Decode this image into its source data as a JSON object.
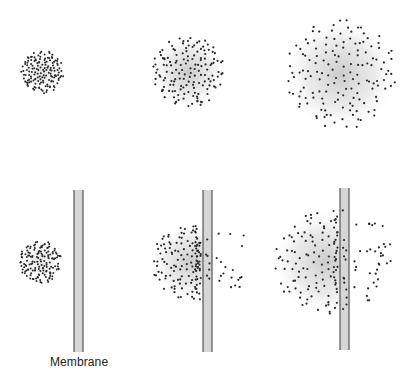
{
  "diagram": {
    "title": "",
    "label_membrane": "Membrane",
    "colors": {
      "dot": "#2a2a2a",
      "cloud": "#9a9a9a",
      "membrane_fill": "#d6d6d6",
      "membrane_edge": "#555555"
    },
    "rows": [
      {
        "name": "free-diffusion",
        "panels": [
          {
            "stage": 1,
            "cx": 42,
            "cy": 72,
            "r": 21,
            "dots": 150,
            "dot_r": 1.0,
            "cloud_r": 20,
            "cloud_opacity": 0.25
          },
          {
            "stage": 2,
            "cx": 188,
            "cy": 72,
            "r": 36,
            "dots": 150,
            "dot_r": 1.1,
            "cloud_r": 38,
            "cloud_opacity": 0.45
          },
          {
            "stage": 3,
            "cx": 341,
            "cy": 74,
            "r": 55,
            "dots": 150,
            "dot_r": 1.1,
            "cloud_r": 58,
            "cloud_opacity": 0.45
          }
        ]
      },
      {
        "name": "diffusion-through-membrane",
        "panels": [
          {
            "stage": 1,
            "cx": 40,
            "cy": 262,
            "r": 21,
            "dots": 150,
            "dot_r": 1.0,
            "cloud_r": 20,
            "cloud_opacity": 0.25,
            "membrane": {
              "x": 74,
              "y": 190,
              "w": 9,
              "h": 162
            },
            "cross_fraction": 0.0
          },
          {
            "stage": 2,
            "cx": 190,
            "cy": 262,
            "r": 38,
            "dots": 150,
            "dot_r": 1.1,
            "cloud_r": 40,
            "cloud_opacity": 0.45,
            "membrane": {
              "x": 203,
              "y": 190,
              "w": 9,
              "h": 162
            },
            "cross_fraction": 0.12
          },
          {
            "stage": 3,
            "cx": 326,
            "cy": 262,
            "r": 52,
            "dots": 150,
            "dot_r": 1.1,
            "cloud_r": 55,
            "cloud_opacity": 0.45,
            "membrane": {
              "x": 340,
              "y": 188,
              "w": 9,
              "h": 162
            },
            "cross_fraction": 0.22
          }
        ]
      }
    ]
  }
}
